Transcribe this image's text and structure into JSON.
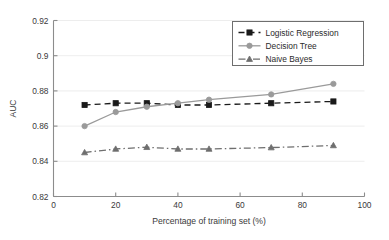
{
  "chart_data": {
    "type": "line",
    "title": "",
    "xlabel": "Percentage of training set (%)",
    "ylabel": "AUC",
    "xlim": [
      0,
      100
    ],
    "ylim": [
      0.82,
      0.92
    ],
    "xticks": [
      0,
      20,
      40,
      60,
      80,
      100
    ],
    "xticklabels": [
      "0",
      "20",
      "40",
      "60",
      "80",
      "100"
    ],
    "yticks": [
      0.82,
      0.84,
      0.86,
      0.88,
      0.9,
      0.92
    ],
    "yticklabels": [
      "0.82",
      "0.84",
      "0.86",
      "0.88",
      "0.9",
      "0.92"
    ],
    "grid": "horizontal",
    "legend_position": "top-right",
    "x": [
      10,
      20,
      30,
      40,
      50,
      70,
      90
    ],
    "series": [
      {
        "name": "Logistic Regression",
        "values": [
          0.872,
          0.873,
          0.873,
          0.872,
          0.872,
          0.873,
          0.874
        ],
        "color": "#1a1a1a",
        "linestyle": "dashed",
        "marker": "square"
      },
      {
        "name": "Decision Tree",
        "values": [
          0.86,
          0.868,
          0.871,
          0.873,
          0.875,
          0.878,
          0.884
        ],
        "color": "#9a9a9a",
        "linestyle": "solid",
        "marker": "circle"
      },
      {
        "name": "Naive Bayes",
        "values": [
          0.845,
          0.847,
          0.848,
          0.847,
          0.847,
          0.8478,
          0.849
        ],
        "color": "#6e6e6e",
        "linestyle": "dashdot",
        "marker": "triangle"
      }
    ]
  },
  "legend": {
    "items": [
      {
        "label": "Logistic Regression"
      },
      {
        "label": "Decision Tree"
      },
      {
        "label": "Naive Bayes"
      }
    ]
  },
  "axes": {
    "xlabel": "Percentage of training set (%)",
    "ylabel": "AUC"
  }
}
